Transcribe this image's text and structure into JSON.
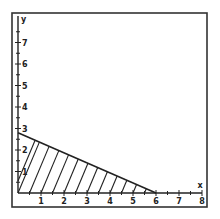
{
  "chart_data": {
    "type": "area",
    "title": "",
    "xlabel": "x",
    "ylabel": "y",
    "xlim": [
      0,
      8
    ],
    "ylim": [
      0,
      8
    ],
    "x_ticks": [
      1,
      2,
      3,
      4,
      5,
      6,
      7,
      8
    ],
    "y_ticks": [
      1,
      2,
      3,
      4,
      5,
      6,
      7
    ],
    "grid": false,
    "legend": null,
    "boundary_line": {
      "from": [
        0,
        2.8
      ],
      "to": [
        6,
        0
      ]
    },
    "shaded_region": {
      "vertices": [
        [
          0,
          0
        ],
        [
          0,
          2.8
        ],
        [
          6,
          0
        ]
      ],
      "fill_style": "hatched"
    }
  },
  "labels": {
    "x_axis": "x",
    "y_axis": "y",
    "x_ticks": [
      "1",
      "2",
      "3",
      "4",
      "5",
      "6",
      "7",
      "8"
    ],
    "y_ticks": [
      "1",
      "2",
      "3",
      "4",
      "5",
      "6",
      "7"
    ]
  },
  "colors": {
    "ink": "#222222",
    "frame": "#333333",
    "background": "#ffffff"
  }
}
